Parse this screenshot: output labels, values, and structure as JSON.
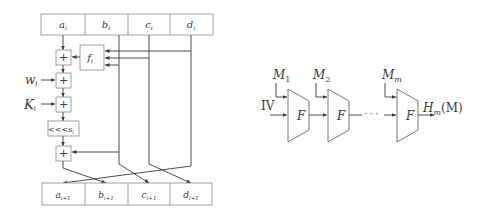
{
  "left_diagram": {
    "title": "MD5 round step",
    "state_in": [
      "a",
      "b",
      "c",
      "d"
    ],
    "state_in_sub": "i",
    "state_out": [
      "a",
      "b",
      "c",
      "d"
    ],
    "state_out_sub": "i+1",
    "function_label": "f",
    "function_sub": "i",
    "adder_symbol": "+",
    "inputs": {
      "w": "w",
      "w_sub": "i",
      "k": "K",
      "k_sub": "i"
    },
    "rotate_label": "<<<s",
    "rotate_sub": "i"
  },
  "right_diagram": {
    "title": "Merkle-Damgard construction",
    "iv_label": "IV",
    "blocks": [
      {
        "label": "M",
        "sub": "1"
      },
      {
        "label": "M",
        "sub": "2"
      },
      {
        "label": "M",
        "sub": "m"
      }
    ],
    "compress_label": "F",
    "ellipsis": "· · ·",
    "output_label": "H",
    "output_sub": "m",
    "output_arg": "(M)"
  }
}
